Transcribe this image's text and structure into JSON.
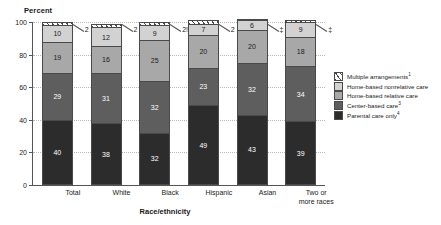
{
  "chart_data": {
    "type": "bar",
    "subtype": "stacked-bar-100",
    "title": "",
    "xlabel": "Race/ethnicity",
    "ylabel": "Percent",
    "ylim": [
      0,
      100
    ],
    "yticks": [
      0,
      20,
      40,
      60,
      80,
      100
    ],
    "grid": "horizontal-dotted",
    "legend_position": "right",
    "categories": [
      "Total",
      "White",
      "Black",
      "Hispanic",
      "Asian",
      "Two or more races"
    ],
    "series": [
      {
        "name": "Parental care only",
        "footnote": "4",
        "color": "#2c2c2c",
        "values": [
          40,
          38,
          32,
          49,
          43,
          39
        ]
      },
      {
        "name": "Center-based care",
        "footnote": "3",
        "color": "#5e5e5e",
        "values": [
          29,
          31,
          32,
          23,
          32,
          34
        ]
      },
      {
        "name": "Home-based relative care",
        "footnote": "",
        "color": "#a8a8a8",
        "values": [
          19,
          16,
          25,
          20,
          20,
          18
        ]
      },
      {
        "name": "Home-based nonrelative care",
        "footnote": "",
        "color": "#d2d2d2",
        "values": [
          10,
          12,
          9,
          7,
          6,
          9
        ]
      },
      {
        "name": "Multiple arrangements",
        "footnote": "1",
        "color": "#ffffff",
        "values": [
          2,
          2,
          2,
          2,
          1,
          1
        ],
        "labels": [
          "2",
          "2",
          "2!",
          "2",
          "‡",
          "‡"
        ]
      }
    ]
  },
  "axis": {
    "y_title": "Percent",
    "x_title": "Race/ethnicity",
    "y_ticks": [
      "100",
      "80",
      "60",
      "40",
      "20",
      "0"
    ]
  },
  "bars": [
    {
      "category": "Total",
      "segments": [
        "40",
        "29",
        "19",
        "10"
      ],
      "callout": "2"
    },
    {
      "category": "White",
      "segments": [
        "38",
        "31",
        "16",
        "12"
      ],
      "callout": "2"
    },
    {
      "category": "Black",
      "segments": [
        "32",
        "32",
        "25",
        "9"
      ],
      "callout": "2!"
    },
    {
      "category": "Hispanic",
      "segments": [
        "49",
        "23",
        "20",
        "7"
      ],
      "callout": "2"
    },
    {
      "category": "Asian",
      "segments": [
        "43",
        "32",
        "20",
        "6"
      ],
      "callout": "‡"
    },
    {
      "category": "Two or more races",
      "segments": [
        "39",
        "34",
        "18",
        "9"
      ],
      "callout": "‡"
    }
  ],
  "legend": {
    "items": [
      {
        "label": "Multiple arrangements",
        "footnote": "1",
        "swatch": "hatched"
      },
      {
        "label": "Home-based nonrelative care",
        "footnote": "",
        "swatch": "light-gray"
      },
      {
        "label": "Home-based relative care",
        "footnote": "",
        "swatch": "mid-gray"
      },
      {
        "label": "Center-based care",
        "footnote": "3",
        "swatch": "dark-gray"
      },
      {
        "label": "Parental care only",
        "footnote": "4",
        "swatch": "black"
      }
    ]
  }
}
